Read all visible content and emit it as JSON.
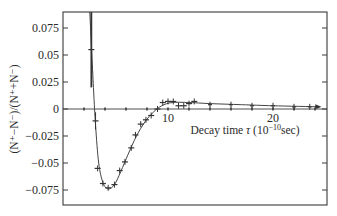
{
  "chart_data": {
    "type": "line",
    "title": "",
    "xlabel": "Decay time τ (10⁻¹⁰sec)",
    "xlabel_parts": {
      "main": "Decay time ",
      "symbol": "τ",
      "unit_open": " (10",
      "unit_exp": "−10",
      "unit_close": "sec)"
    },
    "ylabel": "(N⁺−N⁻)/(N⁺+N⁻)",
    "xlim": [
      0,
      25
    ],
    "ylim": [
      -0.0875,
      0.0875
    ],
    "x_ticks": [
      {
        "value": 10,
        "label": "10"
      },
      {
        "value": 20,
        "label": "20"
      }
    ],
    "x_minor_ticks": [
      2,
      4,
      6,
      8,
      12,
      14,
      16,
      18,
      22,
      24
    ],
    "y_ticks": [
      {
        "value": 0.075,
        "label": "0.075"
      },
      {
        "value": 0.05,
        "label": "0.05"
      },
      {
        "value": 0.025,
        "label": "0.025"
      },
      {
        "value": 0,
        "label": "0"
      },
      {
        "value": -0.025,
        "label": "−0.025"
      },
      {
        "value": -0.05,
        "label": "−0.05"
      },
      {
        "value": -0.075,
        "label": "−0.075"
      }
    ],
    "grid": false,
    "legend": null,
    "series": [
      {
        "name": "measured asymmetry",
        "style": "crosses",
        "points": [
          {
            "x": 2.7,
            "y": 0.055,
            "err": 0.035
          },
          {
            "x": 3.1,
            "y": -0.011,
            "err": 0.008
          },
          {
            "x": 3.3,
            "y": -0.055
          },
          {
            "x": 3.8,
            "y": -0.069
          },
          {
            "x": 4.3,
            "y": -0.073
          },
          {
            "x": 4.9,
            "y": -0.07
          },
          {
            "x": 5.4,
            "y": -0.057
          },
          {
            "x": 5.9,
            "y": -0.049
          },
          {
            "x": 6.5,
            "y": -0.036
          },
          {
            "x": 6.9,
            "y": -0.024
          },
          {
            "x": 7.4,
            "y": -0.014
          },
          {
            "x": 7.9,
            "y": -0.01
          },
          {
            "x": 8.4,
            "y": -0.006
          },
          {
            "x": 9.0,
            "y": 0.0
          },
          {
            "x": 9.5,
            "y": 0.006
          },
          {
            "x": 10.0,
            "y": 0.007
          },
          {
            "x": 10.5,
            "y": 0.007
          },
          {
            "x": 11.0,
            "y": 0.003
          },
          {
            "x": 11.5,
            "y": 0.003
          },
          {
            "x": 12.0,
            "y": 0.005
          },
          {
            "x": 12.5,
            "y": 0.007
          },
          {
            "x": 14.0,
            "y": 0.004
          },
          {
            "x": 16.0,
            "y": 0.004
          },
          {
            "x": 18.0,
            "y": 0.003
          },
          {
            "x": 20.0,
            "y": 0.003
          },
          {
            "x": 22.0,
            "y": 0.002
          },
          {
            "x": 23.5,
            "y": 0.002
          }
        ]
      },
      {
        "name": "fitted curve",
        "style": "solid",
        "points": [
          {
            "x": 2.55,
            "y": 0.09
          },
          {
            "x": 2.9,
            "y": 0.02
          },
          {
            "x": 3.1,
            "y": -0.015
          },
          {
            "x": 3.4,
            "y": -0.05
          },
          {
            "x": 3.8,
            "y": -0.068
          },
          {
            "x": 4.3,
            "y": -0.074
          },
          {
            "x": 4.9,
            "y": -0.07
          },
          {
            "x": 5.5,
            "y": -0.058
          },
          {
            "x": 6.2,
            "y": -0.042
          },
          {
            "x": 7.0,
            "y": -0.025
          },
          {
            "x": 7.8,
            "y": -0.012
          },
          {
            "x": 8.6,
            "y": -0.003
          },
          {
            "x": 9.4,
            "y": 0.003
          },
          {
            "x": 10.4,
            "y": 0.006
          },
          {
            "x": 12.0,
            "y": 0.006
          },
          {
            "x": 14.0,
            "y": 0.005
          },
          {
            "x": 17.0,
            "y": 0.004
          },
          {
            "x": 20.0,
            "y": 0.003
          },
          {
            "x": 24.5,
            "y": 0.002
          }
        ]
      }
    ]
  }
}
